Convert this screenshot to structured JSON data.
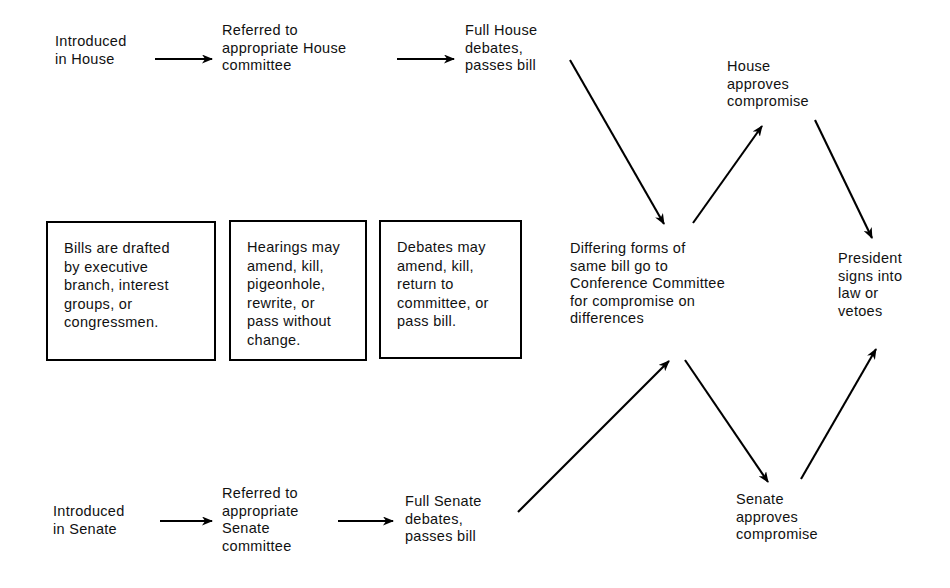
{
  "diagram": {
    "type": "flowchart",
    "background_color": "#ffffff",
    "line_color": "#000000",
    "text_color": "#111111",
    "nodes": [
      {
        "id": "introduced-house",
        "label": "Introduced\nin House",
        "shape": "plain",
        "x": 55,
        "y": 33,
        "w": 115
      },
      {
        "id": "referred-house-committee",
        "label": "Referred to\nappropriate House\ncommittee",
        "shape": "plain",
        "x": 222,
        "y": 22,
        "w": 180
      },
      {
        "id": "full-house-debates",
        "label": "Full House\ndebates,\npasses bill",
        "shape": "plain",
        "x": 465,
        "y": 22,
        "w": 120
      },
      {
        "id": "house-approves-compromise",
        "label": "House\napproves\ncompromise",
        "shape": "plain",
        "x": 727,
        "y": 58,
        "w": 130
      },
      {
        "id": "bills-drafted",
        "label": "Bills are drafted\nby executive\nbranch, interest\ngroups, or\ncongressmen.",
        "shape": "box",
        "x": 46,
        "y": 221,
        "w": 170,
        "h": 140
      },
      {
        "id": "hearings-may",
        "label": "Hearings may\namend, kill,\npigeonhole,\nrewrite, or\npass without\nchange.",
        "shape": "box",
        "x": 229,
        "y": 220,
        "w": 138,
        "h": 141
      },
      {
        "id": "debates-may",
        "label": "Debates may\namend, kill,\nreturn to\ncommittee, or\npass bill.",
        "shape": "box",
        "x": 379,
        "y": 220,
        "w": 143,
        "h": 139
      },
      {
        "id": "conference-committee",
        "label": "Differing forms of\nsame bill go to\nConference Committee\nfor compromise on\ndifferences",
        "shape": "plain",
        "x": 570,
        "y": 240,
        "w": 215
      },
      {
        "id": "president-signs",
        "label": "President\nsigns into\nlaw or\nvetoes",
        "shape": "plain",
        "x": 838,
        "y": 250,
        "w": 110
      },
      {
        "id": "senate-approves-compromise",
        "label": "Senate\napproves\ncompromise",
        "shape": "plain",
        "x": 736,
        "y": 491,
        "w": 130
      },
      {
        "id": "introduced-senate",
        "label": "Introduced\nin Senate",
        "shape": "plain",
        "x": 53,
        "y": 503,
        "w": 120
      },
      {
        "id": "referred-senate-committee",
        "label": "Referred to\nappropriate\nSenate\ncommittee",
        "shape": "plain",
        "x": 222,
        "y": 485,
        "w": 150
      },
      {
        "id": "full-senate-debates",
        "label": "Full Senate\ndebates,\npasses bill",
        "shape": "plain",
        "x": 405,
        "y": 493,
        "w": 120
      }
    ],
    "edges": [
      {
        "id": "edge-house-1",
        "from": "introduced-house",
        "to": "referred-house-committee",
        "x1": 155,
        "y1": 59,
        "x2": 212,
        "y2": 59,
        "style": "straight-arrow"
      },
      {
        "id": "edge-house-2",
        "from": "referred-house-committee",
        "to": "full-house-debates",
        "x1": 397,
        "y1": 59,
        "x2": 454,
        "y2": 59,
        "style": "straight-arrow"
      },
      {
        "id": "edge-house-to-conference",
        "from": "full-house-debates",
        "to": "conference-committee",
        "x1": 570,
        "y1": 60,
        "x2": 664,
        "y2": 224,
        "style": "straight-arrow"
      },
      {
        "id": "edge-conference-to-house-approves",
        "from": "conference-committee",
        "to": "house-approves-compromise",
        "x1": 693,
        "y1": 223,
        "x2": 762,
        "y2": 126,
        "style": "straight-arrow"
      },
      {
        "id": "edge-house-approves-to-president",
        "from": "house-approves-compromise",
        "to": "president-signs",
        "x1": 815,
        "y1": 120,
        "x2": 872,
        "y2": 238,
        "style": "straight-arrow"
      },
      {
        "id": "edge-senate-1",
        "from": "introduced-senate",
        "to": "referred-senate-committee",
        "x1": 160,
        "y1": 521,
        "x2": 212,
        "y2": 521,
        "style": "straight-arrow"
      },
      {
        "id": "edge-senate-2",
        "from": "referred-senate-committee",
        "to": "full-senate-debates",
        "x1": 338,
        "y1": 521,
        "x2": 393,
        "y2": 521,
        "style": "straight-arrow"
      },
      {
        "id": "edge-senate-to-conference",
        "from": "full-senate-debates",
        "to": "conference-committee",
        "x1": 518,
        "y1": 512,
        "x2": 669,
        "y2": 361,
        "style": "straight-arrow"
      },
      {
        "id": "edge-conference-to-senate-approves",
        "from": "conference-committee",
        "to": "senate-approves-compromise",
        "x1": 685,
        "y1": 360,
        "x2": 768,
        "y2": 482,
        "style": "straight-arrow"
      },
      {
        "id": "edge-senate-approves-to-president",
        "from": "senate-approves-compromise",
        "to": "president-signs",
        "x1": 801,
        "y1": 479,
        "x2": 876,
        "y2": 349,
        "style": "straight-arrow"
      }
    ]
  }
}
